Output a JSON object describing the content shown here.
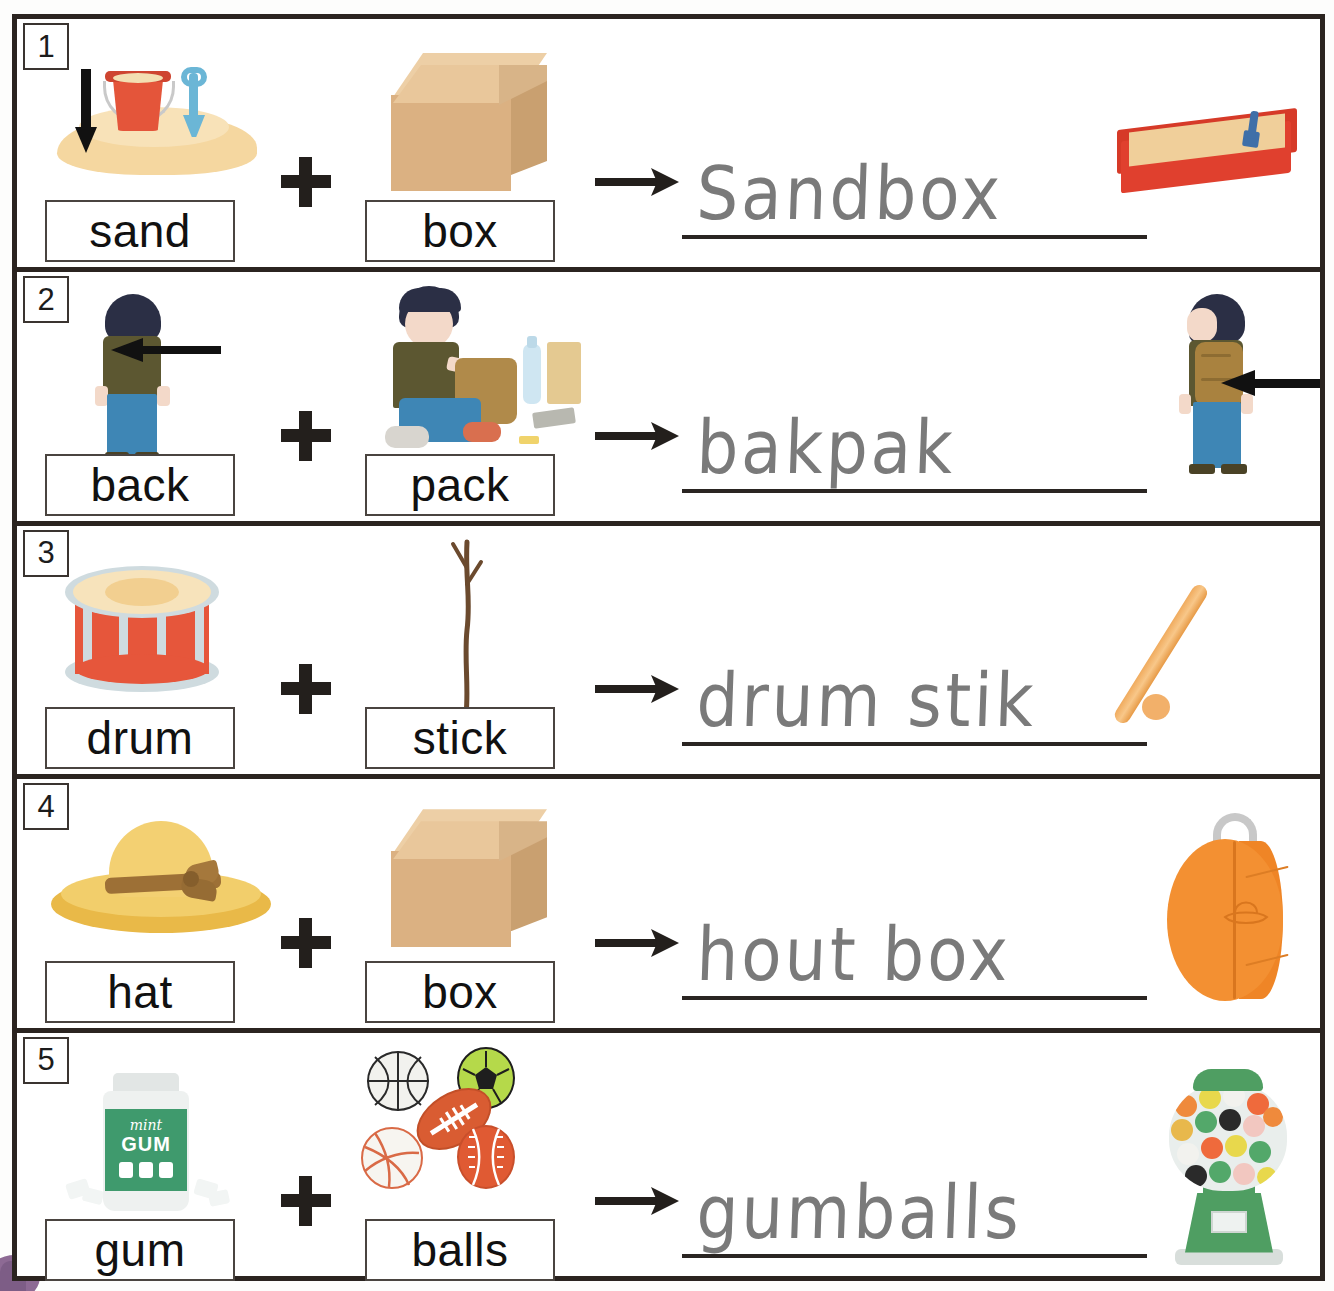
{
  "worksheet": {
    "title": "Compound Words Worksheet",
    "symbols": {
      "plus": "+",
      "arrow": "→"
    },
    "rows": [
      {
        "number": "1",
        "word_a": "sand",
        "word_b": "box",
        "answer": "Sandbox",
        "pic_a": "sand-pile-with-bucket-and-shovel",
        "pic_b": "cardboard-box",
        "pic_result": "red-sandbox"
      },
      {
        "number": "2",
        "word_a": "back",
        "word_b": "pack",
        "answer": "bakpak",
        "pic_a": "child-from-behind",
        "pic_b": "child-packing-backpack",
        "pic_result": "child-wearing-backpack"
      },
      {
        "number": "3",
        "word_a": "drum",
        "word_b": "stick",
        "answer": "drum stik",
        "pic_a": "snare-drum",
        "pic_b": "wooden-twig",
        "pic_result": "drumstick"
      },
      {
        "number": "4",
        "word_a": "hat",
        "word_b": "box",
        "answer": "hout box",
        "pic_a": "yellow-sun-hat",
        "pic_b": "cardboard-box",
        "pic_result": "orange-hat-box"
      },
      {
        "number": "5",
        "word_a": "gum",
        "word_b": "balls",
        "answer": "gumballs",
        "pic_a": "mint-gum-bottle",
        "pic_b": "sports-balls",
        "pic_result": "gumball-machine"
      }
    ],
    "gum_bottle_label": {
      "flavor": "mint",
      "product": "GUM"
    },
    "colors": {
      "frame": "#2b2420",
      "handwriting": "#6f6f6f",
      "sandbox_red": "#e0402e",
      "drum_red": "#e6563b",
      "hat_yellow": "#f3d072",
      "hatbox_orange": "#f39032",
      "gum_green": "#3f9a6d",
      "machine_green": "#4f9e62",
      "corner_blob": "#8d6a94"
    }
  }
}
